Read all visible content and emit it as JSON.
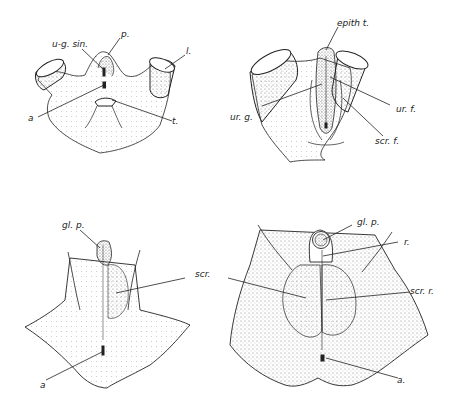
{
  "figure": {
    "panels": [
      {
        "id": "A",
        "position": "top-left",
        "labels": {
          "ug_sin": "u-g. sin.",
          "p": "p.",
          "l": "l.",
          "a": "a",
          "t": "t."
        }
      },
      {
        "id": "B",
        "position": "top-right",
        "labels": {
          "epith_t": "epith t.",
          "ur_g": "ur. g.",
          "ur_f": "ur. f.",
          "scr_f": "scr. f."
        }
      },
      {
        "id": "C",
        "position": "bottom-left",
        "labels": {
          "gl_p": "gl. p.",
          "scr": "scr.",
          "a": "a"
        }
      },
      {
        "id": "D",
        "position": "bottom-right",
        "labels": {
          "gl_p": "gl. p.",
          "r": "r.",
          "scr_r": "scr. r.",
          "a": "a."
        }
      }
    ],
    "colors": {
      "ink": "#222222",
      "stipple": "#8a8a8a",
      "background": "#ffffff"
    }
  }
}
